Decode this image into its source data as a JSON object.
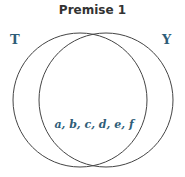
{
  "title": "Premise 1",
  "sets": {
    "left": {
      "label": "T"
    },
    "right": {
      "label": "Y"
    }
  },
  "intersection": {
    "members": "a, b, c, d, e, f"
  },
  "colors": {
    "label": "#2e5d78",
    "title": "#333333",
    "stroke": "#444444"
  }
}
